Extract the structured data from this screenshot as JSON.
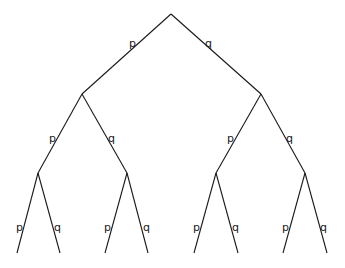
{
  "diagram": {
    "type": "probability-tree",
    "levels": 3,
    "branch_labels": {
      "left": "p",
      "right": "q"
    },
    "nodes": {
      "root": [
        171,
        14
      ],
      "l1": [
        [
          82,
          94
        ],
        [
          261,
          94
        ]
      ],
      "l2": [
        [
          38,
          173
        ],
        [
          127,
          173
        ],
        [
          216,
          173
        ],
        [
          305,
          173
        ]
      ],
      "leaves": [
        [
          17,
          253
        ],
        [
          60,
          253
        ],
        [
          105,
          253
        ],
        [
          148,
          253
        ],
        [
          194,
          253
        ],
        [
          238,
          253
        ],
        [
          283,
          253
        ],
        [
          327,
          253
        ]
      ]
    },
    "labels": {
      "l1_left": "p",
      "l1_right": "q",
      "l2": [
        "p",
        "q",
        "p",
        "q"
      ],
      "l3": [
        "p",
        "q",
        "p",
        "q",
        "p",
        "q",
        "p",
        "q"
      ]
    },
    "line_color": "#1a1a1a"
  }
}
